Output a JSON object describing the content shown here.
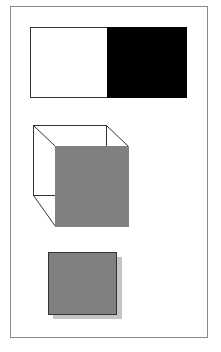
{
  "figure": {
    "colors": {
      "background": "#ffffff",
      "frame_border": "#8a8a8a",
      "outline": "#333333",
      "black_fill": "#000000",
      "gray_fill": "#808080",
      "shadow": "#c4c4c4"
    },
    "shapes": [
      {
        "name": "split-rectangle",
        "description": "Rectangle with white left half and black right half"
      },
      {
        "name": "wireframe-cube",
        "description": "Cube outline with gray front face"
      },
      {
        "name": "shadowed-square",
        "description": "Gray square with drop shadow"
      }
    ]
  }
}
